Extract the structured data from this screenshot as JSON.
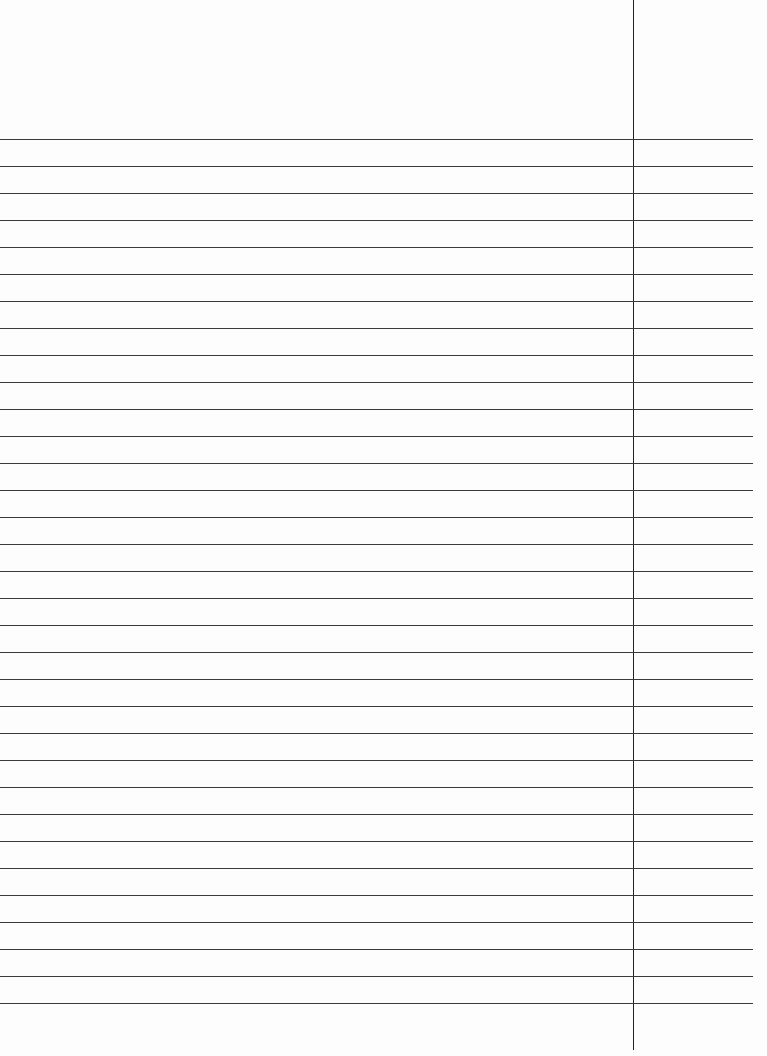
{
  "sheet": {
    "type": "lined-paper",
    "background": "#fdfdfd",
    "rule_color": "#3a3a3a",
    "margin_color": "#222222",
    "first_rule_y": 139,
    "rule_spacing": 27,
    "rule_count": 33,
    "rule_end_x": 753,
    "margin_x": 633,
    "margin_top": 0,
    "margin_bottom": 1050
  }
}
